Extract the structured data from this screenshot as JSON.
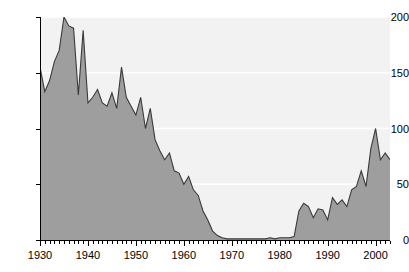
{
  "chart_data": {
    "type": "area",
    "title": "",
    "subtitle": "",
    "xlabel": "",
    "ylabel": "",
    "xlim": [
      1930,
      2003
    ],
    "ylim": [
      0,
      200
    ],
    "grid": true,
    "grid_color": "#ffffff",
    "legend": null,
    "plot_background": "#f2f2f2",
    "fill_color": "#9e9e9e",
    "line_color": "#3a3a3a",
    "axis_color": "#000000",
    "y_ticks": [
      0,
      50,
      100,
      150,
      200
    ],
    "y_tick_labels": [
      "0",
      "50",
      "100",
      "150",
      "200"
    ],
    "x_ticks": [
      1930,
      1940,
      1950,
      1960,
      1970,
      1980,
      1990,
      2000
    ],
    "x_tick_labels": [
      "1930",
      "1940",
      "1950",
      "1960",
      "1970",
      "1980",
      "1990",
      "2000"
    ],
    "x_minor_tick_step": 1,
    "x": [
      1930,
      1931,
      1932,
      1933,
      1934,
      1935,
      1936,
      1937,
      1938,
      1939,
      1940,
      1941,
      1942,
      1943,
      1944,
      1945,
      1946,
      1947,
      1948,
      1949,
      1950,
      1951,
      1952,
      1953,
      1954,
      1955,
      1956,
      1957,
      1958,
      1959,
      1960,
      1961,
      1962,
      1963,
      1964,
      1965,
      1966,
      1967,
      1968,
      1969,
      1970,
      1971,
      1972,
      1973,
      1974,
      1975,
      1976,
      1977,
      1978,
      1979,
      1980,
      1981,
      1982,
      1983,
      1984,
      1985,
      1986,
      1987,
      1988,
      1989,
      1990,
      1991,
      1992,
      1993,
      1994,
      1995,
      1996,
      1997,
      1998,
      1999,
      2000,
      2001,
      2002,
      2003
    ],
    "values": [
      155,
      133,
      143,
      160,
      170,
      200,
      192,
      190,
      130,
      188,
      123,
      128,
      135,
      123,
      120,
      132,
      118,
      155,
      128,
      120,
      112,
      128,
      100,
      118,
      90,
      80,
      72,
      78,
      62,
      60,
      50,
      57,
      45,
      40,
      26,
      18,
      8,
      4,
      2,
      1,
      1,
      1,
      1,
      1,
      1,
      1,
      1,
      1,
      2,
      1,
      2,
      2,
      2,
      3,
      26,
      33,
      30,
      20,
      28,
      27,
      18,
      38,
      32,
      36,
      30,
      45,
      48,
      62,
      48,
      82,
      100,
      72,
      78,
      72
    ],
    "series_name": ""
  }
}
